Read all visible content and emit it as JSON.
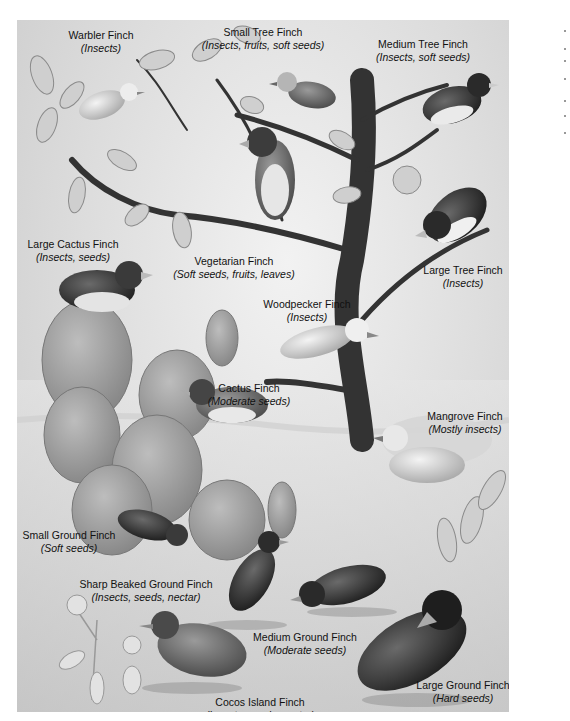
{
  "figure": {
    "colors": {
      "background": "#dcdcdc",
      "tree": "#3a3a3a",
      "cactus": "#9a9a9a",
      "text": "#111111"
    }
  },
  "finches": [
    {
      "name": "Warbler Finch",
      "diet": "(Insects)"
    },
    {
      "name": "Small Tree Finch",
      "diet": "(Insects, fruits, soft seeds)"
    },
    {
      "name": "Medium Tree Finch",
      "diet": "(Insects, soft seeds)"
    },
    {
      "name": "Large Cactus Finch",
      "diet": "(Insects, seeds)"
    },
    {
      "name": "Vegetarian Finch",
      "diet": "(Soft seeds, fruits, leaves)"
    },
    {
      "name": "Large Tree Finch",
      "diet": "(Insects)"
    },
    {
      "name": "Woodpecker Finch",
      "diet": "(Insects)"
    },
    {
      "name": "Cactus Finch",
      "diet": "(Moderate seeds)"
    },
    {
      "name": "Mangrove Finch",
      "diet": "(Mostly insects)"
    },
    {
      "name": "Small Ground Finch",
      "diet": "(Soft seeds)"
    },
    {
      "name": "Sharp Beaked Ground Finch",
      "diet": "(Insects, seeds, nectar)"
    },
    {
      "name": "Medium Ground Finch",
      "diet": "(Moderate seeds)"
    },
    {
      "name": "Large Ground Finch",
      "diet": "(Hard seeds)"
    },
    {
      "name": "Cocos Island Finch",
      "diet": "(Insects, seeds, nectar)"
    }
  ]
}
